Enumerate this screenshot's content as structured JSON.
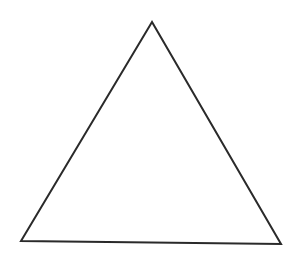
{
  "diagram": {
    "shape": "triangle",
    "stroke_color": "#2a2a2a",
    "fill_color": "none",
    "stroke_width": 2,
    "vertices": {
      "apex": [
        152,
        22
      ],
      "bottom_left": [
        21,
        241
      ],
      "bottom_right": [
        281,
        244
      ]
    }
  }
}
